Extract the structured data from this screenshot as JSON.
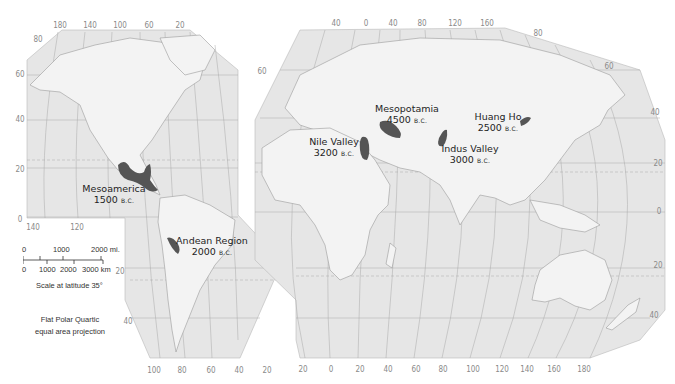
{
  "map": {
    "projection_note": [
      "Flat Polar Quartic",
      "equal area projection"
    ],
    "colors": {
      "ocean": "#e6e6e6",
      "land": "#f3f3f3",
      "border": "#9a9a9a",
      "graticule": "#a8a8a8",
      "hearth": "#555555",
      "label": "#1e1e1e",
      "tick": "#8a8a8a"
    },
    "scale": {
      "miles_labels": [
        "0",
        "1000",
        "2000 mi."
      ],
      "km_labels": [
        "0",
        "1000",
        "2000",
        "3000 km"
      ],
      "caption": "Scale at latitude 35°"
    },
    "sites": [
      {
        "name": "Mesoamerica",
        "date": "1500",
        "era": "B.C."
      },
      {
        "name": "Andean Region",
        "date": "2000",
        "era": "B.C."
      },
      {
        "name": "Nile Valley",
        "date": "3200",
        "era": "B.C."
      },
      {
        "name": "Mesopotamia",
        "date": "4500",
        "era": "B.C."
      },
      {
        "name": "Indus Valley",
        "date": "3000",
        "era": "B.C."
      },
      {
        "name": "Huang Ho",
        "date": "2500",
        "era": "B.C."
      }
    ],
    "ticks": {
      "west_top": [
        "180",
        "140",
        "100",
        "60",
        "20"
      ],
      "west_left": [
        "80",
        "60",
        "40",
        "20",
        "0"
      ],
      "west_bottom_left": [
        "140",
        "120"
      ],
      "west_south_lat": [
        "20",
        "40"
      ],
      "west_bottom": [
        "100",
        "80",
        "60",
        "40",
        "20"
      ],
      "east_top": [
        "40",
        "0",
        "40",
        "80",
        "120",
        "160"
      ],
      "east_lat_left": [
        "60"
      ],
      "east_lat_right": [
        "80",
        "60",
        "40",
        "20",
        "0",
        "20",
        "40"
      ],
      "east_bottom": [
        "20",
        "0",
        "20",
        "40",
        "60",
        "80",
        "100",
        "120",
        "140",
        "160",
        "180"
      ]
    }
  }
}
